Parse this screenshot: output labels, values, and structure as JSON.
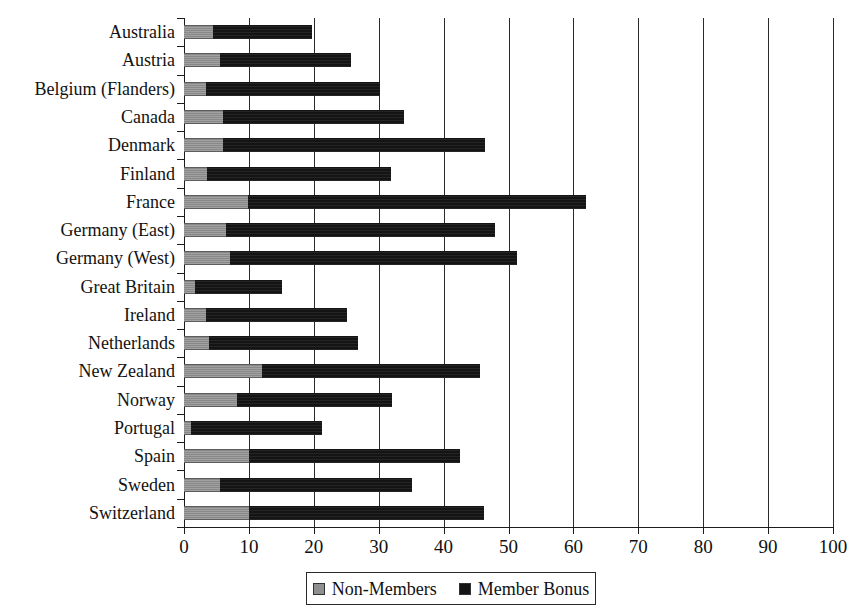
{
  "chart_data": {
    "type": "bar",
    "orientation": "horizontal",
    "stacked": true,
    "title": "",
    "xlabel": "",
    "ylabel": "",
    "xlim": [
      0,
      100
    ],
    "xticks": [
      0,
      10,
      20,
      30,
      40,
      50,
      60,
      70,
      80,
      90,
      100
    ],
    "xtick_labels": [
      "0",
      "10",
      "20",
      "30",
      "40",
      "50",
      "60",
      "70",
      "80",
      "90",
      "100"
    ],
    "grid": "vertical",
    "legend_position": "bottom",
    "categories": [
      "Australia",
      "Austria",
      "Belgium (Flanders)",
      "Canada",
      "Denmark",
      "Finland",
      "France",
      "Germany (East)",
      "Germany (West)",
      "Great Britain",
      "Ireland",
      "Netherlands",
      "New Zealand",
      "Norway",
      "Portugal",
      "Spain",
      "Sweden",
      "Switzerland"
    ],
    "series": [
      {
        "name": "Non-Members",
        "color": "#8f8f8f",
        "values": [
          4.5,
          5.5,
          3.4,
          6.0,
          6.0,
          3.5,
          9.9,
          6.5,
          7.1,
          1.7,
          3.4,
          3.9,
          12.0,
          8.1,
          1.1,
          10.0,
          5.5,
          10.0
        ]
      },
      {
        "name": "Member Bonus",
        "color": "#141414",
        "values": [
          15.2,
          20.2,
          26.8,
          27.9,
          40.4,
          28.4,
          52.0,
          41.4,
          44.2,
          13.4,
          21.7,
          22.9,
          33.6,
          23.9,
          20.1,
          32.5,
          29.6,
          36.2
        ]
      }
    ],
    "totals": [
      19.7,
      25.7,
      30.2,
      33.9,
      46.4,
      31.9,
      61.9,
      47.9,
      51.3,
      15.1,
      25.1,
      26.8,
      45.6,
      32.0,
      21.2,
      42.5,
      35.1,
      46.2
    ]
  },
  "legend": {
    "items": [
      {
        "label": "Non-Members",
        "swatch": "nonmembers"
      },
      {
        "label": "Member Bonus",
        "swatch": "bonus"
      }
    ]
  },
  "title_sliver": ""
}
